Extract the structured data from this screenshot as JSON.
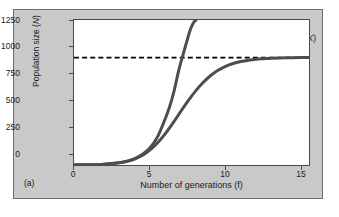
{
  "figure": {
    "panel_label": "(a)",
    "background_color": "#c9c9c9",
    "plot_background_color": "#ffffff",
    "curve_color": "#4d4d4d",
    "axis_color": "#4a4a4a",
    "carrying_capacity_line_color": "#000000"
  },
  "annotation": {
    "line1": "Carrying",
    "line2_pre": "capacity (",
    "line2_italic": "K",
    "line2_post": ")"
  },
  "chart_data": {
    "type": "line",
    "title": "",
    "subtitle": "",
    "xlabel": "Number of generations (f)",
    "ylabel": "Population size (N)",
    "ylabel_pre": "Population size (",
    "ylabel_italic": "N",
    "ylabel_post": ")",
    "xlim": [
      0,
      15.5
    ],
    "ylim": [
      0,
      1350
    ],
    "xticks": [
      0,
      5,
      10,
      15
    ],
    "xtick_labels": [
      "0",
      "5",
      "10",
      "15"
    ],
    "yticks": [
      0,
      250,
      500,
      750,
      1000,
      1250
    ],
    "ytick_labels": [
      "0",
      "250",
      "500",
      "750",
      "1000",
      "1250"
    ],
    "grid": false,
    "legend": "none",
    "annotations": [
      {
        "text": "Carrying capacity (K)",
        "x": 13.2,
        "y": 1180,
        "type": "label"
      }
    ],
    "reference_lines": [
      {
        "name": "carrying-capacity",
        "orientation": "horizontal",
        "y": 1000,
        "style": "dashed",
        "label": "Carrying capacity (K)"
      }
    ],
    "series": [
      {
        "name": "Exponential growth (J-curve)",
        "style": "solid",
        "x": [
          0.0,
          1.0,
          2.0,
          3.0,
          3.5,
          4.0,
          4.5,
          5.0,
          5.5,
          6.0,
          6.3,
          6.6,
          6.9,
          7.2,
          7.5,
          7.7,
          7.9,
          8.05
        ],
        "values": [
          1,
          3,
          8,
          22,
          36,
          59,
          97,
          158,
          259,
          424,
          540,
          688,
          877,
          1030,
          1180,
          1270,
          1330,
          1350
        ]
      },
      {
        "name": "Logistic growth (S-curve)",
        "style": "solid",
        "x": [
          0.0,
          1.0,
          2.0,
          3.0,
          3.5,
          4.0,
          4.5,
          5.0,
          5.5,
          6.0,
          6.5,
          7.0,
          7.5,
          8.0,
          8.5,
          9.0,
          9.5,
          10.0,
          10.5,
          11.0,
          11.5,
          12.0,
          12.5,
          13.0,
          14.0,
          15.0,
          15.5
        ],
        "values": [
          1,
          3,
          8,
          21,
          34,
          55,
          88,
          138,
          205,
          288,
          385,
          490,
          592,
          686,
          766,
          831,
          882,
          919,
          945,
          963,
          976,
          985,
          990,
          994,
          998,
          1000,
          1000
        ]
      }
    ]
  }
}
